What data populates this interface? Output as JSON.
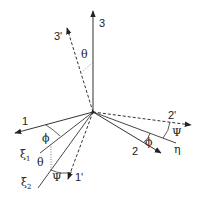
{
  "diagram": {
    "colors": {
      "line": "#222222",
      "dotted": "#555555",
      "background": "#ffffff"
    },
    "axes": [
      {
        "id": "3",
        "label": "3",
        "style": "solid"
      },
      {
        "id": "3p",
        "label": "3'",
        "style": "dashed"
      },
      {
        "id": "1",
        "label": "1",
        "style": "solid"
      },
      {
        "id": "1p",
        "label": "1'",
        "style": "dashed"
      },
      {
        "id": "2",
        "label": "2",
        "style": "solid"
      },
      {
        "id": "2p",
        "label": "2'",
        "style": "dashed"
      },
      {
        "id": "xi1",
        "label": "ξ",
        "subscript": "1",
        "style": "solid"
      },
      {
        "id": "xi2",
        "label": "ξ",
        "subscript": "2",
        "style": "solid"
      },
      {
        "id": "eta",
        "label": "η",
        "style": "solid"
      }
    ],
    "angles": {
      "theta_top": "θ",
      "phi_left": "ϕ",
      "theta_left": "θ",
      "psi_bottom": "Ψ",
      "phi_right": "ϕ",
      "psi_right": "Ψ"
    }
  }
}
